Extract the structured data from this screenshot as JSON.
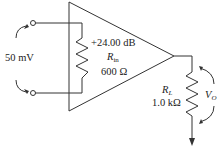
{
  "diagram": {
    "type": "amplifier-circuit",
    "source": {
      "label": "50 mV"
    },
    "amplifier": {
      "gain": "+24.00 dB",
      "rin_symbol": "R",
      "rin_sub": "in",
      "rin_value": "600 Ω"
    },
    "load": {
      "symbol": "R",
      "sub": "L",
      "value": "1.0 kΩ"
    },
    "output": {
      "symbol": "V",
      "sub": "O"
    },
    "colors": {
      "line": "#333333",
      "background": "#ffffff"
    }
  }
}
